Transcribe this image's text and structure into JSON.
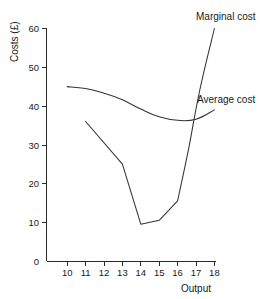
{
  "chart_data": {
    "type": "line",
    "title": "",
    "xlabel": "Output",
    "ylabel": "Costs (£)",
    "xlim": [
      10,
      18
    ],
    "ylim": [
      0,
      60
    ],
    "grid": false,
    "legend_position": "inline-annotations",
    "x_ticks": [
      "10",
      "11",
      "12",
      "13",
      "14",
      "15",
      "16",
      "17",
      "18"
    ],
    "x_tick_values": [
      10,
      11,
      12,
      13,
      14,
      15,
      16,
      17,
      18
    ],
    "y_ticks": [
      "0",
      "10",
      "20",
      "30",
      "40",
      "50",
      "60"
    ],
    "y_tick_values": [
      0,
      10,
      20,
      30,
      40,
      50,
      60
    ],
    "y_origin_label": "0",
    "series": [
      {
        "name": "Marginal cost",
        "label": "Marginal cost",
        "color": "#333333",
        "x": [
          11,
          13,
          14,
          15,
          16,
          16.6,
          17.2,
          18
        ],
        "values": [
          36,
          25,
          9.5,
          10.5,
          15.5,
          29,
          44,
          60
        ]
      },
      {
        "name": "Average cost",
        "label": "Average cost",
        "color": "#333333",
        "x": [
          10,
          11,
          12,
          13,
          14,
          15,
          16,
          17,
          18
        ],
        "values": [
          45,
          44.5,
          43.3,
          41.6,
          39.2,
          37.2,
          36.3,
          36.6,
          39
        ]
      }
    ],
    "annotations": [
      {
        "text": "Marginal cost",
        "x_px": 196,
        "y_px": 20
      },
      {
        "text": "Average cost",
        "x_px": 197,
        "y_px": 103
      }
    ]
  }
}
